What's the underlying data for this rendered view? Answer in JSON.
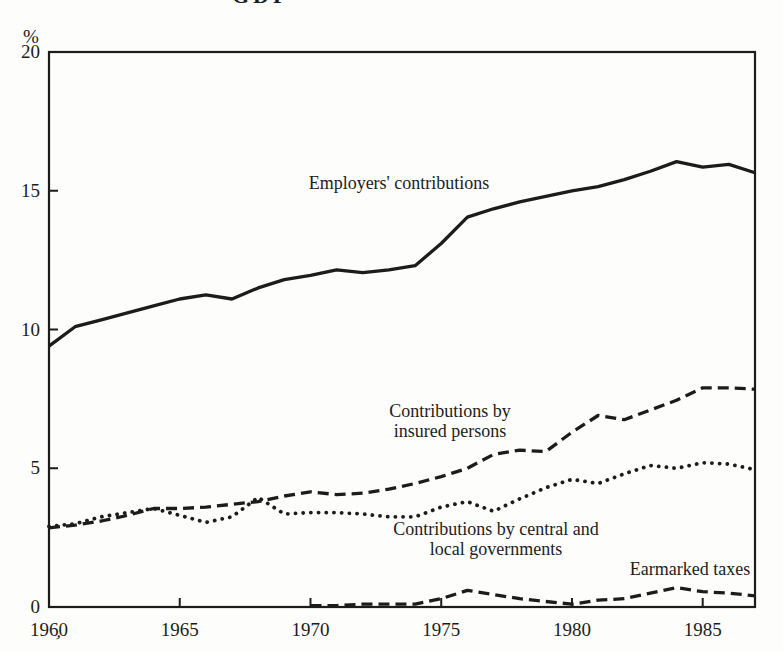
{
  "page_fragments": {
    "top_title_fragment": "GDP",
    "bottom_left_mark": "’"
  },
  "chart_data": {
    "type": "line",
    "title": "",
    "xlabel": "",
    "ylabel": "%",
    "xlim": [
      1960,
      1987
    ],
    "ylim": [
      0,
      20
    ],
    "xticks": [
      1960,
      1965,
      1970,
      1975,
      1980,
      1985
    ],
    "yticks": [
      0,
      5,
      10,
      15,
      20
    ],
    "grid": false,
    "legend_position": "inline-annotations",
    "x": [
      1960,
      1961,
      1962,
      1963,
      1964,
      1965,
      1966,
      1967,
      1968,
      1969,
      1970,
      1971,
      1972,
      1973,
      1974,
      1975,
      1976,
      1977,
      1978,
      1979,
      1980,
      1981,
      1982,
      1983,
      1984,
      1985,
      1986,
      1987
    ],
    "series": [
      {
        "name": "Employers' contributions",
        "line_style": "solid",
        "values": [
          9.4,
          10.1,
          10.35,
          10.6,
          10.85,
          11.1,
          11.25,
          11.1,
          11.5,
          11.8,
          11.95,
          12.15,
          12.05,
          12.15,
          12.3,
          13.1,
          14.05,
          14.35,
          14.6,
          14.8,
          15.0,
          15.15,
          15.4,
          15.7,
          16.05,
          15.85,
          15.95,
          15.65
        ]
      },
      {
        "name": "Contributions by insured persons",
        "line_style": "dashed",
        "values": [
          2.85,
          2.95,
          3.1,
          3.3,
          3.55,
          3.55,
          3.6,
          3.7,
          3.8,
          4.0,
          4.15,
          4.05,
          4.1,
          4.25,
          4.45,
          4.7,
          5.0,
          5.5,
          5.65,
          5.6,
          6.3,
          6.9,
          6.75,
          7.1,
          7.45,
          7.9,
          7.9,
          7.85
        ]
      },
      {
        "name": "Contributions by central and local governments",
        "line_style": "dotted",
        "values": [
          2.9,
          3.0,
          3.25,
          3.4,
          3.55,
          3.3,
          3.05,
          3.25,
          3.95,
          3.35,
          3.4,
          3.4,
          3.35,
          3.25,
          3.25,
          3.6,
          3.8,
          3.45,
          3.9,
          4.3,
          4.6,
          4.45,
          4.8,
          5.1,
          5.0,
          5.2,
          5.15,
          4.95
        ]
      },
      {
        "name": "Earmarked taxes",
        "line_style": "dashed",
        "values": [
          null,
          null,
          null,
          null,
          null,
          null,
          null,
          null,
          null,
          null,
          0.05,
          0.05,
          0.1,
          0.1,
          0.1,
          0.3,
          0.6,
          0.45,
          0.3,
          0.2,
          0.1,
          0.25,
          0.3,
          0.5,
          0.7,
          0.55,
          0.5,
          0.4
        ]
      }
    ],
    "annotations": [
      {
        "id": "employers",
        "lines": [
          "Employers' contributions"
        ],
        "x": 1973.4,
        "y": 15.2
      },
      {
        "id": "insured",
        "lines": [
          "Contributions by",
          "insured persons"
        ],
        "x": 1975.3,
        "y": 6.7
      },
      {
        "id": "government",
        "lines": [
          "Contributions by central and",
          "local governments"
        ],
        "x": 1977.2,
        "y": 2.4
      },
      {
        "id": "earmarked",
        "lines": [
          "Earmarked taxes"
        ],
        "x": 1984.5,
        "y": 1.35
      }
    ]
  }
}
